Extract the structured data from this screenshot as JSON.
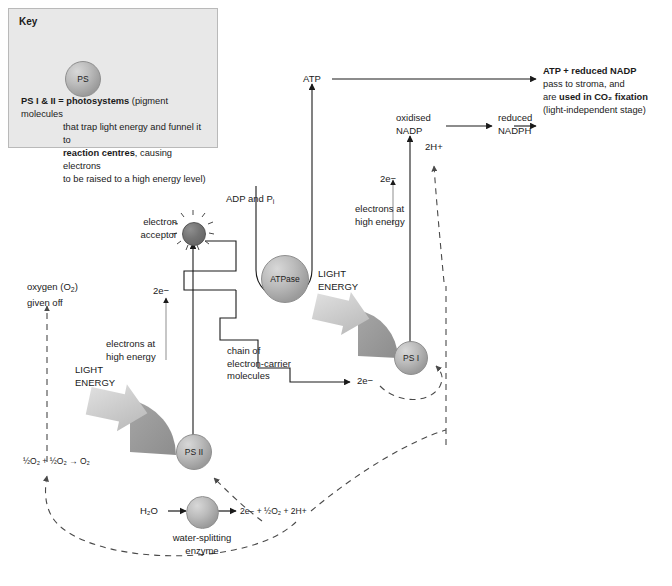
{
  "diagram": {
    "key": {
      "heading": "Key",
      "sphere_label": "PS",
      "definition_line1_bold_a": "PS I & II = ",
      "definition_line1_bold_b": "photosystems",
      "definition_line1_rest": " (pigment molecules",
      "definition_line2": "that trap light energy and funnel it to",
      "definition_line3_bold": "reaction centres",
      "definition_line3_rest": ", causing electrons",
      "definition_line4": "to be raised to a high energy level)"
    },
    "labels": {
      "oxygen_given_off_l1": "oxygen (O",
      "oxygen_given_off_l1b": ") ",
      "oxygen_given_off_l2": "given off",
      "oxygen_equation": "½O₂ + ½O₂ → O₂",
      "light_energy_left_l1": "LIGHT",
      "light_energy_left_l2": "ENERGY",
      "light_energy_right_l1": "LIGHT",
      "light_energy_right_l2": "ENERGY",
      "electrons_high_energy_left_l1": "electrons at",
      "electrons_high_energy_left_l2": "high energy",
      "electrons_high_energy_right_l1": "electrons at",
      "electrons_high_energy_right_l2": "high energy",
      "two_electrons_left": "2e−",
      "two_electrons_chain": "2e−",
      "two_electrons_right": "2e−",
      "two_protons": "2H+",
      "electron_acceptor_l1": "electron",
      "electron_acceptor_l2": "acceptor",
      "adp_and_pi": "ADP and P",
      "adp_and_pi_sub": "i",
      "atpase": "ATPase",
      "atp": "ATP",
      "chain_l1": "chain of",
      "chain_l2": "electron-carrier",
      "chain_l3": "molecules",
      "ps_two": "PS II",
      "ps_one": "PS I",
      "oxidised_l1": "oxidised",
      "oxidised_l2": "NADP",
      "reduced_l1": "reduced",
      "reduced_l2": "NADPH",
      "water": "H₂O",
      "water_products": "2e− + ½O₂ + 2H+",
      "water_splitting_l1": "water-splitting",
      "water_splitting_l2": "enzyme"
    },
    "outcome": {
      "line1_bold": "ATP + reduced NADP",
      "line2": "pass to stroma, and",
      "line3_plain": "are ",
      "line3_bold": "used in CO₂ fixation",
      "line4": "(light-independent stage)"
    },
    "colors": {
      "key_bg": "#e8e8e8",
      "key_border": "#b9b9b9",
      "fan_gray": "#9a9a9a",
      "sphere_gray": "#bcbcbc",
      "dark_sphere": "#6e6e6e",
      "line": "#1a1a1a",
      "dashed": "#4a4a4a",
      "light_arrow": "#c9c9c9"
    }
  }
}
